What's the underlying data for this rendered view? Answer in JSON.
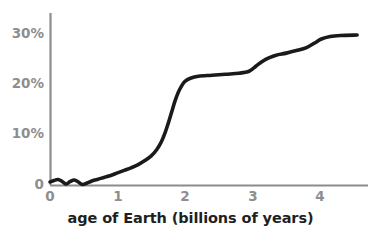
{
  "chart_data": {
    "type": "line",
    "title": "",
    "xlabel": "age of Earth (billions of years)",
    "ylabel": "",
    "xlim": [
      0,
      4.7
    ],
    "ylim": [
      0,
      33
    ],
    "grid": false,
    "legend": null,
    "series": [
      {
        "name": "atmospheric oxygen",
        "color": "#1a1a1a",
        "points": [
          [
            0.0,
            0.6
          ],
          [
            0.06,
            0.9
          ],
          [
            0.12,
            1.1
          ],
          [
            0.18,
            0.7
          ],
          [
            0.24,
            0.2
          ],
          [
            0.3,
            0.7
          ],
          [
            0.36,
            1.0
          ],
          [
            0.42,
            0.6
          ],
          [
            0.48,
            0.1
          ],
          [
            0.55,
            0.4
          ],
          [
            0.62,
            0.8
          ],
          [
            0.7,
            1.1
          ],
          [
            0.8,
            1.5
          ],
          [
            0.9,
            1.9
          ],
          [
            1.0,
            2.4
          ],
          [
            1.1,
            2.9
          ],
          [
            1.2,
            3.4
          ],
          [
            1.3,
            4.0
          ],
          [
            1.4,
            4.8
          ],
          [
            1.5,
            5.8
          ],
          [
            1.58,
            7.0
          ],
          [
            1.65,
            8.6
          ],
          [
            1.7,
            10.2
          ],
          [
            1.75,
            12.2
          ],
          [
            1.8,
            14.4
          ],
          [
            1.85,
            16.6
          ],
          [
            1.9,
            18.4
          ],
          [
            1.95,
            19.7
          ],
          [
            2.0,
            20.6
          ],
          [
            2.08,
            21.2
          ],
          [
            2.2,
            21.6
          ],
          [
            2.4,
            21.8
          ],
          [
            2.6,
            22.0
          ],
          [
            2.8,
            22.2
          ],
          [
            2.95,
            22.6
          ],
          [
            3.05,
            23.6
          ],
          [
            3.15,
            24.6
          ],
          [
            3.25,
            25.3
          ],
          [
            3.35,
            25.8
          ],
          [
            3.5,
            26.2
          ],
          [
            3.65,
            26.7
          ],
          [
            3.8,
            27.3
          ],
          [
            3.92,
            28.2
          ],
          [
            4.02,
            29.0
          ],
          [
            4.15,
            29.5
          ],
          [
            4.3,
            29.7
          ],
          [
            4.55,
            29.8
          ]
        ]
      }
    ],
    "y_ticks": [
      {
        "value": 0,
        "label": "0"
      },
      {
        "value": 10,
        "label": "10%"
      },
      {
        "value": 20,
        "label": "20%"
      },
      {
        "value": 30,
        "label": "30%"
      }
    ],
    "x_ticks": [
      {
        "value": 0,
        "label": "0"
      },
      {
        "value": 1,
        "label": "1"
      },
      {
        "value": 2,
        "label": "2"
      },
      {
        "value": 3,
        "label": "3"
      },
      {
        "value": 4,
        "label": "4"
      }
    ],
    "axis_color": "#8c8c8c",
    "tick_label_color": "#8e8e8e",
    "title_color": "#1f1f1f"
  }
}
